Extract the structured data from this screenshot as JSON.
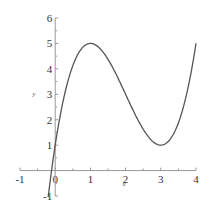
{
  "chart_data": {
    "type": "line",
    "title": "",
    "xlabel": "x",
    "ylabel": "y",
    "xlim": [
      -1,
      4
    ],
    "ylim": [
      -1,
      6
    ],
    "grid": false,
    "legend": null,
    "x_ticks": [
      "-1",
      "0",
      "1",
      "2",
      "3",
      "4"
    ],
    "y_ticks": [
      "-1",
      "1",
      "2",
      "3",
      "4",
      "5",
      "6"
    ],
    "function": "y = x^3 - 6x^2 + 9x + 1",
    "series": [
      {
        "name": "f(x)",
        "color": "#555555",
        "x": [
          -0.2,
          0,
          0.25,
          0.5,
          0.75,
          1,
          1.25,
          1.5,
          1.75,
          2,
          2.25,
          2.5,
          2.75,
          3,
          3.25,
          3.5,
          3.75,
          4
        ],
        "y": [
          -1.05,
          1,
          2.89,
          4.13,
          4.77,
          5,
          4.83,
          4.38,
          3.73,
          3,
          2.27,
          1.63,
          1.17,
          1,
          1.2,
          1.88,
          3.11,
          5
        ]
      }
    ],
    "annotations": [
      {
        "text": "local maximum",
        "x": 1,
        "y": 5
      },
      {
        "text": "local minimum",
        "x": 3,
        "y": 1
      }
    ]
  },
  "axes": {
    "x_label": "x",
    "y_label": "y"
  }
}
